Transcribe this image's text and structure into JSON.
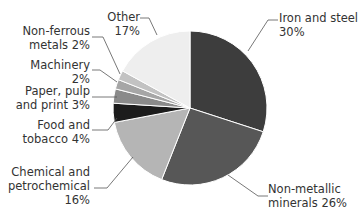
{
  "chart_data": {
    "type": "pie",
    "title": "",
    "start_angle_deg": 0,
    "direction": "clockwise",
    "slices": [
      {
        "label": "Iron and steel",
        "value": 30,
        "color": "#3d3d3d"
      },
      {
        "label": "Non-metallic minerals",
        "value": 26,
        "color": "#575757"
      },
      {
        "label": "Chemical and petrochemical",
        "value": 16,
        "color": "#b5b5b5"
      },
      {
        "label": "Food and tobacco",
        "value": 4,
        "color": "#1c1c1c"
      },
      {
        "label": "Paper, pulp and print",
        "value": 3,
        "color": "#8a8a8a"
      },
      {
        "label": "Machinery",
        "value": 2,
        "color": "#a6a6a6"
      },
      {
        "label": "Non-ferrous metals",
        "value": 2,
        "color": "#c2c2c2"
      },
      {
        "label": "Other",
        "value": 17,
        "color": "#eeeeee"
      }
    ]
  },
  "labels": {
    "iron": {
      "line1": "Iron and steel",
      "line2": "30%"
    },
    "nonmetallic": {
      "line1": "Non-metallic",
      "line2": "minerals 26%"
    },
    "chemical": {
      "line1": "Chemical and",
      "line2": "petrochemical",
      "line3": "16%"
    },
    "food": {
      "line1": "Food and",
      "line2": "tobacco 4%"
    },
    "paper": {
      "line1": "Paper, pulp",
      "line2": "and print 3%"
    },
    "machinery": {
      "line1": "Machinery",
      "line2": "2%"
    },
    "nonferrous": {
      "line1": "Non-ferrous",
      "line2": "metals 2%"
    },
    "other": {
      "line1": "Other",
      "line2": "17%"
    }
  }
}
